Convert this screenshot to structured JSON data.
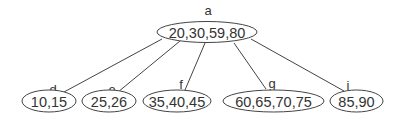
{
  "diagram": {
    "type": "tree",
    "root": {
      "label": "a",
      "keys": "20,30,59,80"
    },
    "children": [
      {
        "label": "d",
        "keys": "10,15"
      },
      {
        "label": "e",
        "keys": "25,26"
      },
      {
        "label": "f",
        "keys": "35,40,45"
      },
      {
        "label": "g",
        "keys": "60,65,70,75"
      },
      {
        "label": "i",
        "keys": "85,90"
      }
    ],
    "edges": [
      {
        "from": "a",
        "to": "d"
      },
      {
        "from": "a",
        "to": "e"
      },
      {
        "from": "a",
        "to": "f"
      },
      {
        "from": "a",
        "to": "g"
      },
      {
        "from": "a",
        "to": "i"
      }
    ]
  }
}
